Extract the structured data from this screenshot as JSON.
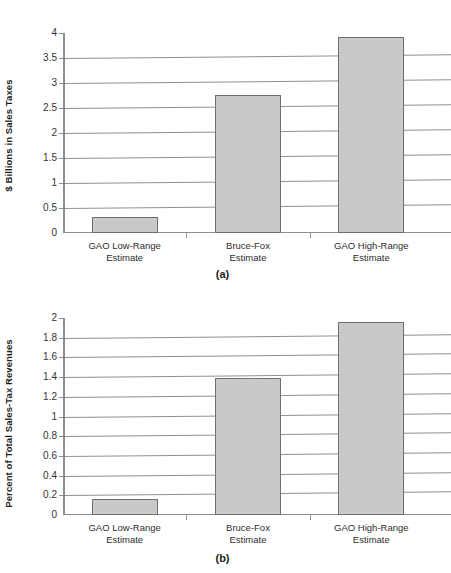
{
  "chart_data": [
    {
      "id": "a",
      "type": "bar",
      "title": "",
      "caption": "(a)",
      "categories": [
        "GAO Low-Range\nEstimate",
        "Bruce-Fox\nEstimate",
        "GAO High-Range\nEstimate"
      ],
      "values": [
        0.32,
        2.77,
        3.93
      ],
      "xlabel": "",
      "ylabel": "$ Billions in Sales Taxes",
      "ylim": [
        0,
        4
      ],
      "ytick_step": 0.5,
      "yticks": [
        "4",
        "3.5",
        "3",
        "2.5",
        "2",
        "1.5",
        "1",
        "0.5",
        "0"
      ],
      "grid": true,
      "legend": "none",
      "bar_color": "#c9c9c9",
      "bar_border_color": "#6f6f6f"
    },
    {
      "id": "b",
      "type": "bar",
      "title": "",
      "caption": "(b)",
      "categories": [
        "GAO Low-Range\nEstimate",
        "Bruce-Fox\nEstimate",
        "GAO High-Range\nEstimate"
      ],
      "values": [
        0.16,
        1.39,
        1.96
      ],
      "xlabel": "",
      "ylabel": "Percent of Total Sales-Tax Revenues",
      "ylim": [
        0,
        2
      ],
      "ytick_step": 0.2,
      "yticks": [
        "2",
        "1.8",
        "1.6",
        "1.4",
        "1.2",
        "1",
        "0.8",
        "0.6",
        "0.4",
        "0.2",
        "0"
      ],
      "grid": true,
      "legend": "none",
      "bar_color": "#c9c9c9",
      "bar_border_color": "#6f6f6f"
    }
  ]
}
